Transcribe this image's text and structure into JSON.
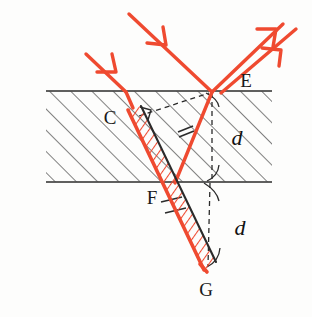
{
  "figure": {
    "background_color": "#fdfdfc",
    "ray_color": "#ef4a30",
    "ink_color": "#2b2b2b",
    "hatch_color": "#3a3a3a"
  },
  "labels": {
    "point_c": "C",
    "point_e": "E",
    "point_f": "F",
    "point_g": "G",
    "distance_upper": "d",
    "distance_lower": "d"
  },
  "geometry": {
    "slab_top_y": 91,
    "slab_bottom_y": 182,
    "slab_left_x": 46,
    "slab_right_x": 272,
    "point_c": {
      "x": 137,
      "y": 113
    },
    "point_e": {
      "x": 213,
      "y": 91
    },
    "point_f": {
      "x": 174,
      "y": 182
    },
    "point_g": {
      "x": 206,
      "y": 270
    },
    "incident_ray_1_start": {
      "x": 86,
      "y": 54
    },
    "incident_ray_1_end": {
      "x": 124,
      "y": 91
    },
    "incident_ray_2_start": {
      "x": 129,
      "y": 14
    },
    "incident_ray_2_end": {
      "x": 213,
      "y": 91
    },
    "outgoing_ray_1_start": {
      "x": 213,
      "y": 91
    },
    "outgoing_ray_1_end": {
      "x": 283,
      "y": 24
    },
    "outgoing_ray_2_start": {
      "x": 228,
      "y": 91
    },
    "outgoing_ray_2_end": {
      "x": 295,
      "y": 30
    }
  },
  "annotations": {
    "hatching": "diagonal-lines-45deg",
    "dashed_vertical_upper": "from E down to bottom surface",
    "dashed_vertical_lower": "from bottom surface down to G",
    "dashed_construction": "from C up-right to E",
    "tick_marks": "double tick on ray segments",
    "right_angle_mark_at_c": true,
    "arc_bracket_upper": true,
    "arc_bracket_lower": true
  }
}
